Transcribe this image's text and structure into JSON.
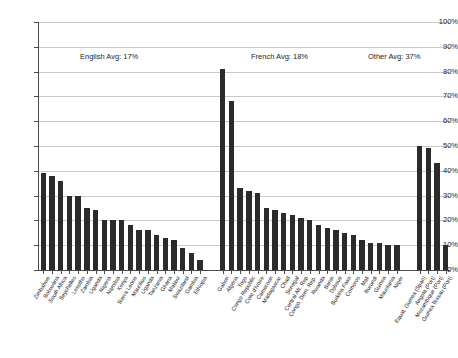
{
  "chart_data": {
    "type": "bar",
    "title": "",
    "xlabel": "",
    "ylabel": "",
    "ylim": [
      0,
      100
    ],
    "grid": true,
    "legend": "none",
    "ytick_labels": [
      "100%",
      "90%",
      "80%",
      "70%",
      "60%",
      "50%",
      "40%",
      "30%",
      "20%",
      "10%",
      "0%"
    ],
    "ytick_values": [
      100,
      90,
      80,
      70,
      60,
      50,
      40,
      30,
      20,
      10,
      0
    ],
    "bar_color": "#2b2b2b",
    "categories": [
      "Zimbabwe",
      "Botswana",
      "South Africa",
      "Seychelles",
      "Lesotho",
      "Zambia",
      "Uganda",
      "Nigeria",
      "Namibia",
      "Kenya",
      "Sierra Leone",
      "Mauritius",
      "Uganda",
      "Tanzania",
      "Ghana",
      "Malawi",
      "Swaziland",
      "Gambia",
      "Ethiopia",
      "Gabon",
      "Algeria",
      "Togo",
      "Congo Republic",
      "Cote d'Ivoire",
      "Cameroon",
      "Madagascar",
      "Chad",
      "Senegal",
      "Central Afr. Rep",
      "Congo, Dem. Rep.",
      "Rwanda",
      "Benin",
      "Djibouti",
      "Burkina Faso",
      "Comoros",
      "Mali",
      "Burundi",
      "Guinea",
      "Mauritania",
      "Niger",
      "Equat. Guinea (Span)",
      "Angola (Port)",
      "Mozambique (Port)",
      "Guinea Bissau (Port)"
    ],
    "values": [
      39,
      38,
      36,
      30,
      30,
      25,
      24,
      20,
      20,
      20,
      18,
      16,
      16,
      14,
      13,
      12,
      9,
      7,
      4,
      81,
      68,
      33,
      32,
      31,
      25,
      24,
      23,
      22,
      21,
      20,
      18,
      17,
      16,
      15,
      14,
      12,
      11,
      11,
      10,
      10,
      50,
      49,
      43,
      10
    ],
    "groups": [
      {
        "name": "English",
        "start_index": 0,
        "end_index": 18,
        "avg": 17
      },
      {
        "name": "French",
        "start_index": 19,
        "end_index": 39,
        "avg": 18
      },
      {
        "name": "Other",
        "start_index": 40,
        "end_index": 43,
        "avg": 37
      }
    ],
    "annotations": [
      {
        "text": "English Avg: 17%",
        "x_px": 80,
        "y_px": 52
      },
      {
        "text": "French Avg: 18%",
        "x_px": 251,
        "y_px": 52
      },
      {
        "text": "Other Avg: 37%",
        "x_px": 368,
        "y_px": 52
      }
    ]
  }
}
